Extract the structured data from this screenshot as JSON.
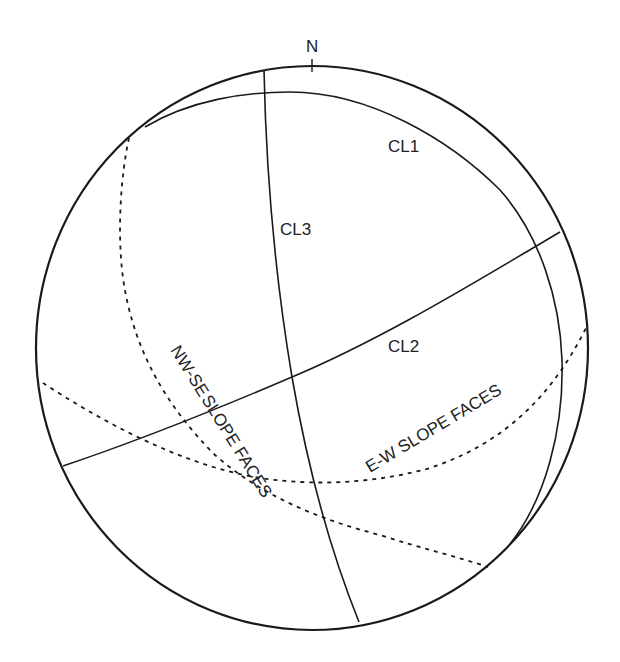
{
  "diagram": {
    "type": "stereonet",
    "north_label": "N",
    "colors": {
      "line": "#1a1a1a",
      "text": "#222222",
      "background": "#ffffff"
    },
    "great_circles": [
      {
        "id": "CL1",
        "label": "CL1",
        "style": "solid"
      },
      {
        "id": "CL2",
        "label": "CL2",
        "style": "solid"
      },
      {
        "id": "CL3",
        "label": "CL3",
        "style": "solid"
      },
      {
        "id": "nw-se-slope-faces",
        "label": "NW-SE SLOPE FACES",
        "style": "dashed"
      },
      {
        "id": "e-w-slope-faces",
        "label": "E-W SLOPE FACES",
        "style": "dashed"
      }
    ]
  },
  "labels": {
    "north": "N",
    "cl1": "CL1",
    "cl2": "CL2",
    "cl3": "CL3",
    "nw_se_part1": "NW-SE",
    "nw_se_part2": "SLOPE  FACES",
    "e_w": "E-W SLOPE FACES"
  }
}
